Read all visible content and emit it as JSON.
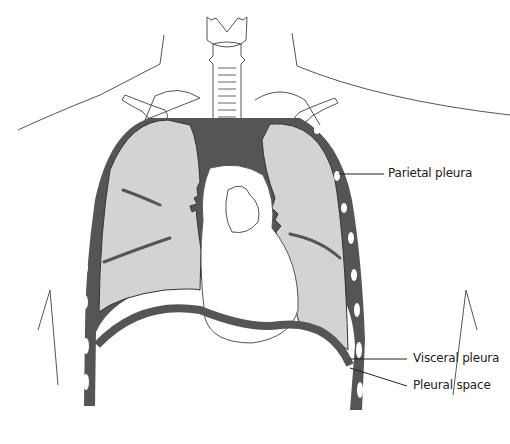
{
  "diagram": {
    "colors": {
      "pleura": "#555555",
      "lung": "#d3d3d3",
      "outline": "#444444",
      "background": "#ffffff"
    },
    "labels": [
      {
        "id": "parietal-pleura",
        "text": "Parietal pleura"
      },
      {
        "id": "visceral-pleura",
        "text": "Visceral pleura"
      },
      {
        "id": "pleural-space",
        "text": "Pleural space"
      }
    ]
  }
}
